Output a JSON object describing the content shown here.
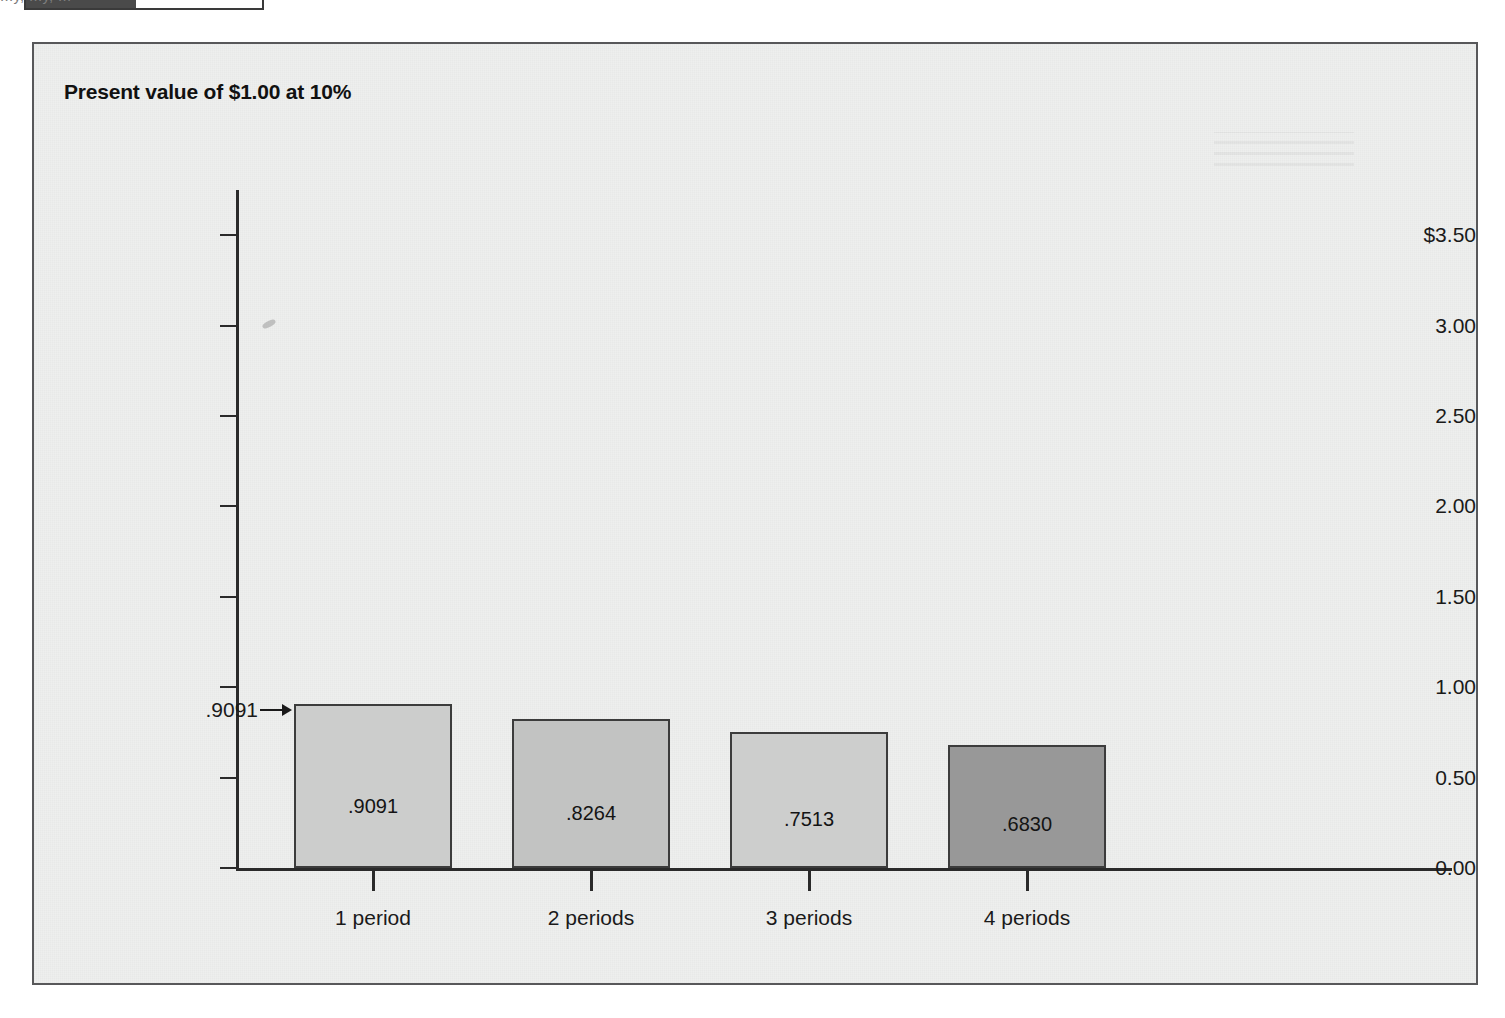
{
  "top_strip": {
    "swatch_legend_name": "legend-swatch",
    "cropped_caption": "...y, ...y, ...",
    "cropped_caption_left": 560
  },
  "figure": {
    "title": "Present value of $1.00 at 10%",
    "background_color": "#eeefee",
    "border_color": "#58585a"
  },
  "chart_data": {
    "type": "bar",
    "title": "Present value of $1.00 at 10%",
    "xlabel": "",
    "ylabel": "",
    "categories": [
      "1 period",
      "2 periods",
      "3 periods",
      "4 periods"
    ],
    "values": [
      0.9091,
      0.8264,
      0.7513,
      0.683
    ],
    "value_labels": [
      ".9091",
      ".8264",
      ".7513",
      ".6830"
    ],
    "bar_colors": [
      "#cccdcc",
      "#c2c3c2",
      "#cdcecd",
      "#989898"
    ],
    "ylim": [
      0.0,
      3.75
    ],
    "ytick_values": [
      0.0,
      0.5,
      1.0,
      1.5,
      2.0,
      2.5,
      3.0,
      3.5
    ],
    "ytick_labels": [
      "0.00",
      "0.50",
      "1.00",
      "1.50",
      "2.00",
      "2.50",
      "3.00",
      "$3.50"
    ],
    "grid": false,
    "legend": false,
    "annotation": {
      "text": ".9091",
      "target_series_index": 0,
      "arrow": "right-arrow-icon"
    }
  }
}
